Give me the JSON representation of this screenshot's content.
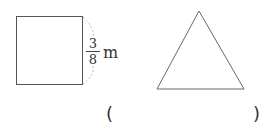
{
  "figure": {
    "square": {
      "side_label": {
        "numerator": "3",
        "denominator": "8",
        "unit": "m"
      }
    },
    "triangle": {
      "type": "equilateral"
    },
    "answer": {
      "open_paren": "(",
      "close_paren": ")",
      "value": ""
    }
  }
}
